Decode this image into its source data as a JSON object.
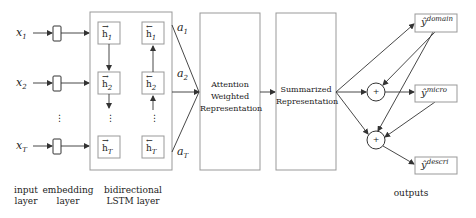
{
  "diagram": {
    "inputs": [
      {
        "symbol": "x",
        "subscript": "1"
      },
      {
        "symbol": "x",
        "subscript": "2"
      },
      {
        "symbol": "x",
        "subscript": "T"
      }
    ],
    "ellipsis": "⋮",
    "lstm": {
      "forward": [
        {
          "arrow": "→",
          "symbol": "h",
          "subscript": "1"
        },
        {
          "arrow": "→",
          "symbol": "h",
          "subscript": "2"
        },
        {
          "arrow": "→",
          "symbol": "h",
          "subscript": "T"
        }
      ],
      "backward": [
        {
          "arrow": "←",
          "symbol": "h",
          "subscript": "1"
        },
        {
          "arrow": "←",
          "symbol": "h",
          "subscript": "2"
        },
        {
          "arrow": "←",
          "symbol": "h",
          "subscript": "T"
        }
      ]
    },
    "attention_weights": [
      {
        "symbol": "a",
        "subscript": "1"
      },
      {
        "symbol": "a",
        "subscript": "2"
      },
      {
        "symbol": "a",
        "subscript": "T"
      }
    ],
    "attention_box": {
      "line1": "Attention",
      "line2": "Weighted",
      "line3": "Representation"
    },
    "summary_box": {
      "line1": "Summarized",
      "line2": "Representation"
    },
    "combine_symbol": "+",
    "outputs": [
      {
        "symbol": "ŷ",
        "superscript": "domain"
      },
      {
        "symbol": "ŷ",
        "superscript": "micro"
      },
      {
        "symbol": "ŷ",
        "superscript": "descri"
      }
    ],
    "bottom_labels": {
      "input_layer": {
        "line1": "input",
        "line2": "layer"
      },
      "embedding_layer": {
        "line1": "embedding",
        "line2": "layer"
      },
      "lstm_layer": {
        "line1": "bidirectional",
        "line2": "LSTM layer"
      },
      "outputs": {
        "line1": "outputs"
      }
    }
  },
  "colors": {
    "stroke": "#333333",
    "box_border": "#888888",
    "text": "#222222"
  }
}
